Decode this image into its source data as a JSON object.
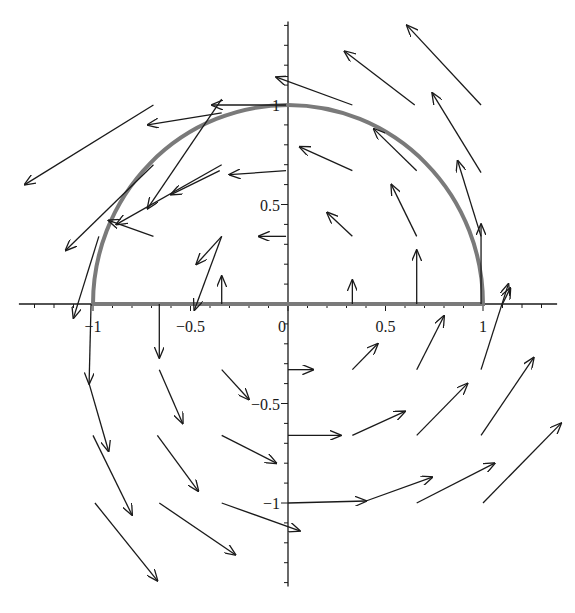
{
  "diagram": {
    "type": "vector_field_with_curve",
    "colors": {
      "axes": "#1a1a1a",
      "arrows": "#1a1a1a",
      "curve": "#7a7a7a",
      "background": "#ffffff"
    },
    "axes": {
      "origin_px": [
        288,
        304
      ],
      "unit_px_x": 195,
      "unit_px_y": 199,
      "x_range": [
        -1.38,
        1.38
      ],
      "y_range": [
        -1.42,
        1.42
      ],
      "x_tick_labels": [
        {
          "value": -1,
          "label": "−1"
        },
        {
          "value": -0.5,
          "label": "−0.5"
        },
        {
          "value": 0,
          "label": "0"
        },
        {
          "value": 0.5,
          "label": "0.5"
        },
        {
          "value": 1,
          "label": "1"
        }
      ],
      "y_tick_labels": [
        {
          "value": 1,
          "label": "1"
        },
        {
          "value": 0.5,
          "label": "0.5"
        },
        {
          "value": -0.5,
          "label": "−0.5"
        },
        {
          "value": -1,
          "label": "−1"
        }
      ]
    },
    "curve": {
      "name": "upper semicircle of radius 1 with diameter from (-1,0) to (1,0)",
      "radius": 1
    },
    "arrows": [
      {
        "from": [
          -0.34,
          1.03
        ],
        "to": [
          -0.72,
          0.48
        ]
      },
      {
        "from": [
          -0.69,
          1.0
        ],
        "to": [
          -1.35,
          0.6
        ]
      },
      {
        "from": [
          -0.01,
          1.0
        ],
        "to": [
          -0.39,
          1.0
        ]
      },
      {
        "from": [
          -0.34,
          0.96
        ],
        "to": [
          -0.72,
          0.9
        ]
      },
      {
        "from": [
          -0.69,
          0.7
        ],
        "to": [
          -1.14,
          0.27
        ]
      },
      {
        "from": [
          -0.34,
          0.7
        ],
        "to": [
          -0.88,
          0.4
        ]
      },
      {
        "from": [
          -0.01,
          0.67
        ],
        "to": [
          -0.3,
          0.65
        ]
      },
      {
        "from": [
          -0.35,
          0.67
        ],
        "to": [
          -0.6,
          0.55
        ]
      },
      {
        "from": [
          -0.69,
          0.34
        ],
        "to": [
          -0.92,
          0.42
        ]
      },
      {
        "from": [
          -0.34,
          0.34
        ],
        "to": [
          -0.48,
          -0.03
        ]
      },
      {
        "from": [
          -0.01,
          0.34
        ],
        "to": [
          -0.15,
          0.34
        ]
      },
      {
        "from": [
          -0.34,
          0.34
        ],
        "to": [
          -0.47,
          0.2
        ]
      },
      {
        "from": [
          -0.97,
          0.34
        ],
        "to": [
          -1.1,
          -0.07
        ]
      },
      {
        "from": [
          0.33,
          1.0
        ],
        "to": [
          -0.06,
          1.14
        ]
      },
      {
        "from": [
          0.65,
          1.0
        ],
        "to": [
          0.29,
          1.27
        ]
      },
      {
        "from": [
          0.99,
          1.0
        ],
        "to": [
          0.61,
          1.4
        ]
      },
      {
        "from": [
          0.33,
          0.67
        ],
        "to": [
          0.06,
          0.79
        ]
      },
      {
        "from": [
          0.66,
          0.67
        ],
        "to": [
          0.44,
          0.88
        ]
      },
      {
        "from": [
          0.99,
          0.66
        ],
        "to": [
          0.74,
          1.06
        ]
      },
      {
        "from": [
          0.33,
          0.34
        ],
        "to": [
          0.2,
          0.46
        ]
      },
      {
        "from": [
          0.66,
          0.34
        ],
        "to": [
          0.53,
          0.6
        ]
      },
      {
        "from": [
          0.99,
          0.34
        ],
        "to": [
          0.87,
          0.72
        ]
      },
      {
        "from": [
          0.33,
          0.0
        ],
        "to": [
          0.33,
          0.12
        ]
      },
      {
        "from": [
          0.66,
          0.0
        ],
        "to": [
          0.66,
          0.27
        ]
      },
      {
        "from": [
          0.99,
          0.0
        ],
        "to": [
          0.99,
          0.4
        ]
      },
      {
        "from": [
          1.1,
          0.0
        ],
        "to": [
          1.14,
          0.08
        ]
      },
      {
        "from": [
          -1.01,
          0.0
        ],
        "to": [
          -1.02,
          -0.4
        ]
      },
      {
        "from": [
          -0.66,
          0.0
        ],
        "to": [
          -0.66,
          -0.27
        ]
      },
      {
        "from": [
          -0.34,
          0.0
        ],
        "to": [
          -0.34,
          0.14
        ]
      },
      {
        "from": [
          -1.02,
          -0.4
        ],
        "to": [
          -0.92,
          -0.74
        ]
      },
      {
        "from": [
          -0.66,
          -0.33
        ],
        "to": [
          -0.54,
          -0.6
        ]
      },
      {
        "from": [
          -0.34,
          -0.33
        ],
        "to": [
          -0.2,
          -0.48
        ]
      },
      {
        "from": [
          -1.0,
          -0.66
        ],
        "to": [
          -0.8,
          -1.06
        ]
      },
      {
        "from": [
          -0.67,
          -0.66
        ],
        "to": [
          -0.46,
          -0.94
        ]
      },
      {
        "from": [
          -0.34,
          -0.66
        ],
        "to": [
          -0.06,
          -0.8
        ]
      },
      {
        "from": [
          -0.99,
          -1.0
        ],
        "to": [
          -0.67,
          -1.39
        ]
      },
      {
        "from": [
          -0.66,
          -1.0
        ],
        "to": [
          -0.27,
          -1.26
        ]
      },
      {
        "from": [
          -0.34,
          -1.0
        ],
        "to": [
          0.06,
          -1.14
        ]
      },
      {
        "from": [
          0.0,
          -0.33
        ],
        "to": [
          0.13,
          -0.33
        ]
      },
      {
        "from": [
          0.33,
          -0.33
        ],
        "to": [
          0.46,
          -0.2
        ]
      },
      {
        "from": [
          0.66,
          -0.33
        ],
        "to": [
          0.8,
          -0.06
        ]
      },
      {
        "from": [
          0.99,
          -0.33
        ],
        "to": [
          1.13,
          0.1
        ]
      },
      {
        "from": [
          0.0,
          -0.66
        ],
        "to": [
          0.27,
          -0.66
        ]
      },
      {
        "from": [
          0.33,
          -0.66
        ],
        "to": [
          0.6,
          -0.54
        ]
      },
      {
        "from": [
          0.66,
          -0.66
        ],
        "to": [
          0.92,
          -0.4
        ]
      },
      {
        "from": [
          0.99,
          -0.66
        ],
        "to": [
          1.26,
          -0.27
        ]
      },
      {
        "from": [
          0.0,
          -1.0
        ],
        "to": [
          0.4,
          -0.99
        ]
      },
      {
        "from": [
          0.4,
          -0.99
        ],
        "to": [
          0.74,
          -0.87
        ]
      },
      {
        "from": [
          0.66,
          -1.0
        ],
        "to": [
          1.06,
          -0.8
        ]
      },
      {
        "from": [
          1.0,
          -1.0
        ],
        "to": [
          1.4,
          -0.6
        ]
      }
    ]
  }
}
